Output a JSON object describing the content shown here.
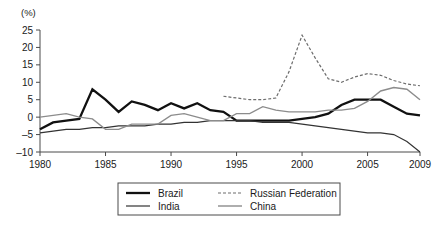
{
  "chart_data": {
    "type": "line",
    "title": "",
    "subtitle": "",
    "xlabel": "",
    "ylabel": "(%)",
    "unit_label": "(%)",
    "xlim": [
      1980,
      2009
    ],
    "ylim": [
      -10,
      25
    ],
    "yticks": [
      -10,
      -5,
      0,
      5,
      10,
      15,
      20,
      25
    ],
    "ytick_labels": [
      "–10",
      "–5",
      "0",
      "5",
      "10",
      "15",
      "20",
      "25"
    ],
    "xticks": [
      1980,
      1985,
      1990,
      1995,
      2000,
      2005,
      2009
    ],
    "xtick_labels": [
      "1980",
      "1985",
      "1990",
      "1995",
      "2000",
      "2005",
      "2009"
    ],
    "grid": false,
    "legend_position": "bottom",
    "series": [
      {
        "name": "Brazil",
        "color": "#111111",
        "width": 2.3,
        "dash": "none",
        "x": [
          1980,
          1981,
          1982,
          1983,
          1984,
          1985,
          1986,
          1987,
          1988,
          1989,
          1990,
          1991,
          1992,
          1993,
          1994,
          1995,
          1996,
          1997,
          1998,
          1999,
          2000,
          2001,
          2002,
          2003,
          2004,
          2005,
          2006,
          2007,
          2008,
          2009
        ],
        "values": [
          -3.5,
          -1.5,
          -1.0,
          -0.5,
          8.0,
          5.0,
          1.5,
          4.5,
          3.5,
          2.0,
          4.0,
          2.5,
          4.0,
          2.0,
          1.5,
          -1.0,
          -1.0,
          -1.0,
          -1.0,
          -1.0,
          -0.5,
          0.0,
          1.0,
          3.5,
          5.0,
          5.0,
          5.0,
          3.0,
          1.0,
          0.5
        ]
      },
      {
        "name": "Russian Federation",
        "color": "#6d6d6d",
        "width": 1.2,
        "dash": "3,2",
        "x": [
          1994,
          1995,
          1996,
          1997,
          1998,
          1999,
          2000,
          2001,
          2002,
          2003,
          2004,
          2005,
          2006,
          2007,
          2008,
          2009
        ],
        "values": [
          6.0,
          5.5,
          5.0,
          5.0,
          5.5,
          13.0,
          23.5,
          17.0,
          11.0,
          10.0,
          11.5,
          12.5,
          12.0,
          10.5,
          9.5,
          9.0
        ]
      },
      {
        "name": "India",
        "color": "#333333",
        "width": 1.2,
        "dash": "none",
        "x": [
          1980,
          1981,
          1982,
          1983,
          1984,
          1985,
          1986,
          1987,
          1988,
          1989,
          1990,
          1991,
          1992,
          1993,
          1994,
          1995,
          1996,
          1997,
          1998,
          1999,
          2000,
          2001,
          2002,
          2003,
          2004,
          2005,
          2006,
          2007,
          2008,
          2009
        ],
        "values": [
          -4.5,
          -4.0,
          -3.5,
          -3.5,
          -3.0,
          -3.0,
          -2.5,
          -2.5,
          -2.5,
          -2.0,
          -2.0,
          -1.5,
          -1.5,
          -1.0,
          -1.0,
          -1.0,
          -1.0,
          -1.5,
          -1.5,
          -1.5,
          -2.0,
          -2.5,
          -3.0,
          -3.5,
          -4.0,
          -4.5,
          -4.5,
          -5.0,
          -7.0,
          -10.0
        ]
      },
      {
        "name": "China",
        "color": "#8c8c8c",
        "width": 1.4,
        "dash": "none",
        "x": [
          1980,
          1981,
          1982,
          1983,
          1984,
          1985,
          1986,
          1987,
          1988,
          1989,
          1990,
          1991,
          1992,
          1993,
          1994,
          1995,
          1996,
          1997,
          1998,
          1999,
          2000,
          2001,
          2002,
          2003,
          2004,
          2005,
          2006,
          2007,
          2008,
          2009
        ],
        "values": [
          0.0,
          0.5,
          1.0,
          0.0,
          -0.5,
          -3.5,
          -3.5,
          -2.0,
          -2.0,
          -2.0,
          0.5,
          1.0,
          0.0,
          -1.0,
          -1.0,
          1.0,
          1.0,
          3.0,
          2.0,
          1.5,
          1.5,
          1.5,
          2.0,
          2.0,
          2.5,
          4.5,
          7.5,
          8.5,
          8.0,
          5.0
        ]
      }
    ],
    "legend": [
      {
        "label": "Brazil",
        "color": "#111111",
        "width": 2.3,
        "dash": "none"
      },
      {
        "label": "Russian Federation",
        "color": "#6d6d6d",
        "width": 1.2,
        "dash": "3,2"
      },
      {
        "label": "India",
        "color": "#333333",
        "width": 1.2,
        "dash": "none"
      },
      {
        "label": "China",
        "color": "#8c8c8c",
        "width": 1.4,
        "dash": "none"
      }
    ]
  }
}
